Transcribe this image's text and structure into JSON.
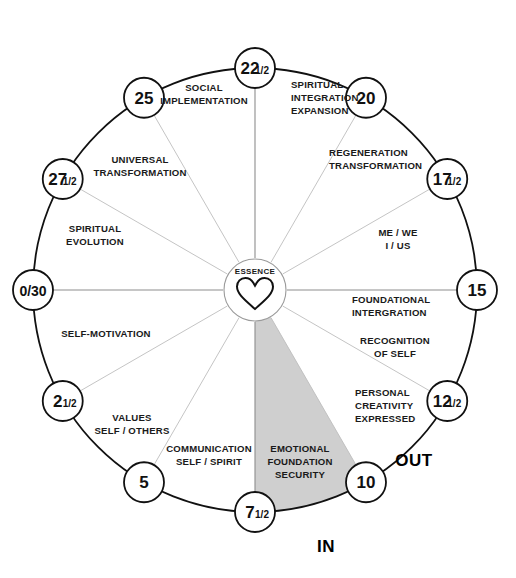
{
  "diagram": {
    "center": {
      "label": "ESSENCE",
      "icon": "heart-icon"
    },
    "orientation_labels": {
      "in": "IN",
      "out": "OUT"
    },
    "colors": {
      "background": "#ffffff",
      "outline": "#111111",
      "spoke": "#bdbdbd",
      "highlight_fill": "#cfcfcf",
      "text": "#1a1a1a"
    },
    "nodes": [
      {
        "id": "n0",
        "main": "0/30",
        "frac": "",
        "angle_deg": 180
      },
      {
        "id": "n2_5",
        "main": "2",
        "frac": "1/2",
        "angle_deg": 210
      },
      {
        "id": "n5",
        "main": "5",
        "frac": "",
        "angle_deg": 240
      },
      {
        "id": "n7_5",
        "main": "7",
        "frac": "1/2",
        "angle_deg": 270
      },
      {
        "id": "n10",
        "main": "10",
        "frac": "",
        "angle_deg": 300
      },
      {
        "id": "n12_5",
        "main": "12",
        "frac": "1/2",
        "angle_deg": 330
      },
      {
        "id": "n15",
        "main": "15",
        "frac": "",
        "angle_deg": 0
      },
      {
        "id": "n17_5",
        "main": "17",
        "frac": "1/2",
        "angle_deg": 30
      },
      {
        "id": "n20",
        "main": "20",
        "frac": "",
        "angle_deg": 60
      },
      {
        "id": "n22_5",
        "main": "22",
        "frac": "1/2",
        "angle_deg": 90
      },
      {
        "id": "n25",
        "main": "25",
        "frac": "",
        "angle_deg": 120
      },
      {
        "id": "n27_5",
        "main": "27",
        "frac": "1/2",
        "angle_deg": 150
      }
    ],
    "sectors": [
      {
        "id": "s-spiritual-integration-expansion",
        "lines": [
          "SPIRITUAL",
          "INTEGRATION",
          "EXPANSION"
        ],
        "from": "22 1/2",
        "to": "20",
        "mid_angle_deg": 75,
        "label_x": 291,
        "label_y": 88,
        "anchor": "start",
        "highlighted": false
      },
      {
        "id": "s-regeneration-transformation",
        "lines": [
          "REGENERATION",
          "TRANSFORMATION"
        ],
        "from": "20",
        "to": "17 1/2",
        "mid_angle_deg": 45,
        "label_x": 329,
        "label_y": 156,
        "anchor": "start",
        "highlighted": false
      },
      {
        "id": "s-me-we-i-us",
        "lines": [
          "ME / WE",
          "I / US"
        ],
        "from": "17 1/2",
        "to": "15",
        "mid_angle_deg": 15,
        "label_x": 398,
        "label_y": 236,
        "anchor": "middle",
        "highlighted": false
      },
      {
        "id": "s-foundational-intergration",
        "lines": [
          "FOUNDATIONAL",
          "INTERGRATION"
        ],
        "from": "15",
        "to": "12 1/2",
        "mid_angle_deg": 345,
        "label_x": 352,
        "label_y": 303,
        "anchor": "start",
        "highlighted": false
      },
      {
        "id": "s-recognition-of-self",
        "lines": [
          "RECOGNITION",
          "OF SELF"
        ],
        "from": "15",
        "to": "12 1/2",
        "mid_angle_deg": 330,
        "label_x": 395,
        "label_y": 344,
        "anchor": "middle",
        "highlighted": false
      },
      {
        "id": "s-personal-creativity-expressed",
        "lines": [
          "PERSONAL",
          "CREATIVITY",
          "EXPRESSED"
        ],
        "from": "12 1/2",
        "to": "10",
        "mid_angle_deg": 315,
        "label_x": 355,
        "label_y": 396,
        "anchor": "start",
        "highlighted": false
      },
      {
        "id": "s-emotional-foundation-security",
        "lines": [
          "EMOTIONAL",
          "FOUNDATION",
          "SECURITY"
        ],
        "from": "7 1/2",
        "to": "10",
        "mid_angle_deg": 285,
        "label_x": 300,
        "label_y": 452,
        "anchor": "middle",
        "highlighted": true
      },
      {
        "id": "s-communication-self-spirit",
        "lines": [
          "COMMUNICATION",
          "SELF / SPIRIT"
        ],
        "from": "5",
        "to": "7 1/2",
        "mid_angle_deg": 255,
        "label_x": 209,
        "label_y": 452,
        "anchor": "middle",
        "highlighted": false
      },
      {
        "id": "s-values-self-others",
        "lines": [
          "VALUES",
          "SELF / OTHERS"
        ],
        "from": "2 1/2",
        "to": "5",
        "mid_angle_deg": 225,
        "label_x": 132,
        "label_y": 421,
        "anchor": "middle",
        "highlighted": false
      },
      {
        "id": "s-self-motivation",
        "lines": [
          "SELF-MOTIVATION"
        ],
        "from": "0/30",
        "to": "2 1/2",
        "mid_angle_deg": 195,
        "label_x": 106,
        "label_y": 337,
        "anchor": "middle",
        "highlighted": false
      },
      {
        "id": "s-spiritual-evolution",
        "lines": [
          "SPIRITUAL",
          "EVOLUTION"
        ],
        "from": "27 1/2",
        "to": "0/30",
        "mid_angle_deg": 165,
        "label_x": 95,
        "label_y": 232,
        "anchor": "middle",
        "highlighted": false
      },
      {
        "id": "s-universal-transformation",
        "lines": [
          "UNIVERSAL",
          "TRANSFORMATION"
        ],
        "from": "25",
        "to": "27 1/2",
        "mid_angle_deg": 135,
        "label_x": 140,
        "label_y": 163,
        "anchor": "middle",
        "highlighted": false
      },
      {
        "id": "s-social-implementation",
        "lines": [
          "SOCIAL",
          "IMPLEMENTATION"
        ],
        "from": "25",
        "to": "22 1/2",
        "mid_angle_deg": 105,
        "label_x": 204,
        "label_y": 91,
        "anchor": "middle",
        "highlighted": false
      }
    ]
  }
}
